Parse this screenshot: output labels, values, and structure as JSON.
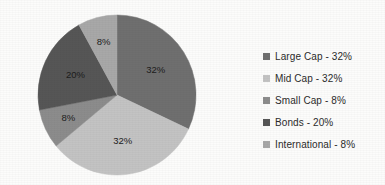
{
  "chart_data": {
    "type": "pie",
    "title": "",
    "subtitle": "",
    "xlabel": "",
    "ylabel": "",
    "grid": false,
    "legend_position": "right",
    "start_angle_deg": 0,
    "direction": "clockwise",
    "categories": [
      "Large Cap",
      "Mid Cap",
      "Small Cap",
      "Bonds",
      "International"
    ],
    "values": [
      32,
      32,
      8,
      20,
      8
    ],
    "value_unit": "%",
    "data_labels": [
      "32%",
      "32%",
      "8%",
      "20%",
      "8%"
    ],
    "legend_labels": [
      "Large Cap - 32%",
      "Mid Cap - 32%",
      "Small Cap - 8%",
      "Bonds - 20%",
      "International - 8%"
    ],
    "slice_colors": [
      "#6f6f6f",
      "#c3c3c3",
      "#8c8c8c",
      "#565656",
      "#a8a8a8"
    ],
    "slices": [
      {
        "label": "Large Cap",
        "value": 32,
        "data_label": "32%",
        "color": "#6f6f6f",
        "legend_label": "Large Cap - 32%"
      },
      {
        "label": "Mid Cap",
        "value": 32,
        "data_label": "32%",
        "color": "#c3c3c3",
        "legend_label": "Mid Cap - 32%"
      },
      {
        "label": "Small Cap",
        "value": 8,
        "data_label": "8%",
        "color": "#8c8c8c",
        "legend_label": "Small Cap - 8%"
      },
      {
        "label": "Bonds",
        "value": 20,
        "data_label": "20%",
        "color": "#565656",
        "legend_label": "Bonds - 20%"
      },
      {
        "label": "International",
        "value": 8,
        "data_label": "8%",
        "color": "#a8a8a8",
        "legend_label": "International - 8%"
      }
    ]
  },
  "legend": {
    "items": [
      {
        "label": "Large Cap - 32%",
        "color": "#6f6f6f"
      },
      {
        "label": "Mid Cap - 32%",
        "color": "#c3c3c3"
      },
      {
        "label": "Small Cap - 8%",
        "color": "#8c8c8c"
      },
      {
        "label": "Bonds - 20%",
        "color": "#565656"
      },
      {
        "label": "International - 8%",
        "color": "#a8a8a8"
      }
    ]
  },
  "labels": {
    "large_cap": "32%",
    "mid_cap": "32%",
    "small_cap": "8%",
    "bonds": "20%",
    "international": "8%"
  },
  "colors": {
    "background": "#fcfcfb",
    "label_text": "#1c1c1c",
    "legend_text": "#2b2b2b"
  }
}
